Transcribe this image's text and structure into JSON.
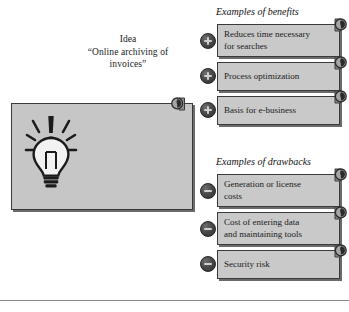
{
  "idea": {
    "title": "Idea",
    "quote_line1": "“Online archiving of",
    "quote_line2": "invoices”",
    "icon": "lightbulb-icon",
    "stamp_icon": "clock-stamp-icon"
  },
  "columns": [
    {
      "id": "benefits",
      "heading": "Examples of benefits",
      "badge_symbol": "+",
      "badge_icon": "plus-circle-icon",
      "items": [
        {
          "line1": "Reduces time necessary",
          "line2": "for searches"
        },
        {
          "line1": "Process optimization",
          "line2": ""
        },
        {
          "line1": "Basis for e-business",
          "line2": ""
        }
      ]
    },
    {
      "id": "drawbacks",
      "heading": "Examples of drawbacks",
      "badge_symbol": "−",
      "badge_icon": "minus-circle-icon",
      "items": [
        {
          "line1": "Generation or license",
          "line2": "costs"
        },
        {
          "line1": "Cost of entering data",
          "line2": "and maintaining tools"
        },
        {
          "line1": "Security risk",
          "line2": ""
        }
      ]
    }
  ],
  "colors": {
    "box_fill": "#c9c9c9",
    "box_border": "#3a3a3a",
    "box_shadow": "#6b6b6b",
    "badge_dark": "#2e2e2e",
    "badge_glyph": "#cfcfcf",
    "text": "#1a1a1a",
    "rule": "#8a8a8a"
  }
}
